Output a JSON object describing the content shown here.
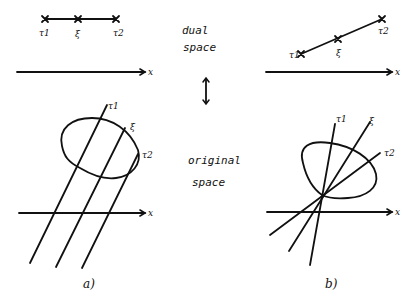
{
  "diagram": {
    "type": "hand-drawn duality illustration",
    "center_labels": {
      "top_line1": "dual",
      "top_line2": "space",
      "arrow": "↕",
      "bottom_line1": "original",
      "bottom_line2": "space"
    },
    "axis_label": "x",
    "panels": [
      {
        "id": "a",
        "caption": "a)",
        "dual": {
          "description": "three collinear points on a horizontal segment above x-axis",
          "points": [
            {
              "label": "τ1",
              "x": 45,
              "y": 19
            },
            {
              "label": "ξ",
              "x": 78,
              "y": 19
            },
            {
              "label": "τ2",
              "x": 116,
              "y": 19
            }
          ]
        },
        "original": {
          "description": "three parallel lines crossing a convex blob",
          "lines": [
            {
              "label": "τ1",
              "from": [
                30,
                263
              ],
              "to": [
                107,
                105
              ]
            },
            {
              "label": "ξ",
              "from": [
                56,
                268
              ],
              "to": [
                125,
                128
              ]
            },
            {
              "label": "τ2",
              "from": [
                82,
                268
              ],
              "to": [
                138,
                154
              ]
            }
          ]
        }
      },
      {
        "id": "b",
        "caption": "b)",
        "dual": {
          "description": "three collinear points on a slanted segment above x-axis",
          "points": [
            {
              "label": "τ1",
              "x": 301,
              "y": 54
            },
            {
              "label": "ξ",
              "x": 338,
              "y": 39
            },
            {
              "label": "τ2",
              "x": 382,
              "y": 19
            }
          ]
        },
        "original": {
          "description": "three lines through a common point on the blob boundary",
          "pivot": [
            322,
            197
          ],
          "lines": [
            {
              "label": "τ1",
              "from": [
                310,
                265
              ],
              "to": [
                335,
                124
              ]
            },
            {
              "label": "ξ",
              "from": [
                289,
                252
              ],
              "to": [
                370,
                122
              ]
            },
            {
              "label": "τ2",
              "from": [
                270,
                235
              ],
              "to": [
                380,
                153
              ]
            }
          ]
        }
      }
    ]
  }
}
